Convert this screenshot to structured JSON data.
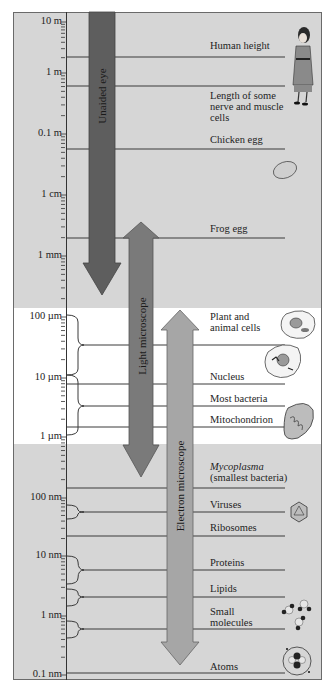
{
  "scale_ticks": [
    {
      "label": "10 m",
      "y": 22
    },
    {
      "label": "1 m",
      "y": 73
    },
    {
      "label": "0.1 m",
      "y": 134
    },
    {
      "label": "1 cm",
      "y": 195
    },
    {
      "label": "1 mm",
      "y": 256
    },
    {
      "label": "100 µm",
      "y": 317
    },
    {
      "label": "10 µm",
      "y": 378
    },
    {
      "label": "1 µm",
      "y": 437
    },
    {
      "label": "100 nm",
      "y": 498
    },
    {
      "label": "10 nm",
      "y": 556
    },
    {
      "label": "1 nm",
      "y": 616
    },
    {
      "label": "0.1 nm",
      "y": 675
    }
  ],
  "arrows": {
    "unaided_eye": {
      "label": "Unaided eye",
      "color": "#5e5e5e"
    },
    "light_microscope": {
      "label": "Light microscope",
      "color": "#7a7a7a"
    },
    "electron_microscope": {
      "label": "Electron microscope",
      "color": "#a6a6a6"
    }
  },
  "items": [
    {
      "label": "Human height",
      "italic": false
    },
    {
      "label": "Length of some nerve and muscle cells",
      "italic": false
    },
    {
      "label": "Chicken egg",
      "italic": false
    },
    {
      "label": "Frog egg",
      "italic": false
    },
    {
      "label": "Plant and animal cells",
      "italic": false
    },
    {
      "label": "Nucleus",
      "italic": false
    },
    {
      "label": "Most bacteria",
      "italic": false
    },
    {
      "label": "Mitochondrion",
      "italic": false
    },
    {
      "label": "Mycoplasma",
      "italic": true,
      "sub": "(smallest bacteria)"
    },
    {
      "label": "Viruses",
      "italic": false
    },
    {
      "label": "Ribosomes",
      "italic": false
    },
    {
      "label": "Proteins",
      "italic": false
    },
    {
      "label": "Lipids",
      "italic": false
    },
    {
      "label": "Small molecules",
      "italic": false
    },
    {
      "label": "Atoms",
      "italic": false
    }
  ],
  "illustrations": [
    "person-icon",
    "egg-icon",
    "plant-cell-icon",
    "animal-cell-icon",
    "mitochondrion-icon",
    "virus-icon",
    "molecules-icon",
    "atom-icon"
  ],
  "colors": {
    "background": "#d6d6d6",
    "light_band": "#ffffff",
    "line": "#3a3a3a"
  }
}
